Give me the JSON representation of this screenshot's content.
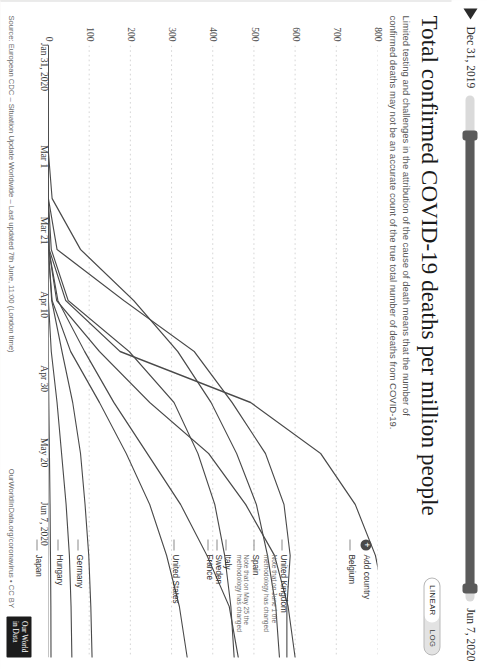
{
  "header": {
    "title": "Total confirmed COVID-19 deaths per million people",
    "subtitle": "Limited testing and challenges in the attribution of the cause of death means that the number of confirmed deaths may not be an accurate count of the true total number of deaths from COVID-19."
  },
  "scale_toggle": {
    "linear_label": "LINEAR",
    "log_label": "LOG",
    "selected": "LINEAR"
  },
  "timeline": {
    "start_label": "Dec 31, 2019",
    "end_label": "Jun 7, 2020",
    "play_icon": "play-icon"
  },
  "legend": {
    "add_country_label": "Add country",
    "add_icon": "plus-circle-icon"
  },
  "footer": {
    "source": "Source: European CDC – Situation Update Worldwide – Last updated 7th June, 11:00 (London time)",
    "owid_link": "OurWorldInData.org/coronavirus • CC BY",
    "logo_line1": "Our World",
    "logo_line2": "in Data"
  },
  "chart_data": {
    "type": "line",
    "title": "Total confirmed COVID-19 deaths per million people",
    "subtitle": "Limited testing and challenges in the attribution of the cause of death means that the number of confirmed deaths may not be an accurate count of the true total number of deaths from COVID-19.",
    "xlabel": "",
    "ylabel": "",
    "scale": "linear",
    "grid": true,
    "legend_position": "right",
    "xlim": [
      "2020-01-31",
      "2020-06-07"
    ],
    "ylim": [
      0,
      800
    ],
    "yticks": [
      0,
      100,
      200,
      300,
      400,
      500,
      600,
      700,
      800
    ],
    "xticks": [
      "Jan 31, 2020",
      "Mar 1",
      "Mar 21",
      "Apr 10",
      "Apr 30",
      "May 20",
      "Jun 7, 2020"
    ],
    "x": [
      "Jan 31",
      "Feb 20",
      "Mar 1",
      "Mar 11",
      "Mar 21",
      "Mar 31",
      "Apr 10",
      "Apr 20",
      "Apr 30",
      "May 10",
      "May 20",
      "May 30",
      "Jun 7"
    ],
    "series": [
      {
        "name": "Belgium",
        "note": "",
        "values": [
          0,
          0,
          0,
          0.3,
          3,
          43,
          175,
          492,
          662,
          746,
          795,
          820,
          832
        ]
      },
      {
        "name": "United Kingdom",
        "note": "Note that on June 1 the methodology has changed",
        "values": [
          0,
          0,
          0,
          0.2,
          2,
          21,
          125,
          247,
          390,
          480,
          550,
          583,
          600
        ]
      },
      {
        "name": "Spain",
        "note": "Note that on May 25 the methodology has changed",
        "values": [
          0,
          0,
          0,
          1,
          22,
          184,
          355,
          447,
          528,
          573,
          588,
          580,
          580
        ]
      },
      {
        "name": "Italy",
        "note": "",
        "values": [
          0,
          0,
          0.1,
          10,
          79,
          208,
          315,
          396,
          458,
          506,
          533,
          553,
          562
        ]
      },
      {
        "name": "Sweden",
        "note": "",
        "values": [
          0,
          0,
          0,
          0.1,
          2,
          24,
          89,
          160,
          241,
          322,
          386,
          440,
          462
        ]
      },
      {
        "name": "France",
        "note": "",
        "values": [
          0,
          0,
          0.03,
          0.7,
          8,
          49,
          197,
          306,
          364,
          405,
          429,
          444,
          452
        ]
      },
      {
        "name": "United States",
        "note": "",
        "values": [
          0,
          0,
          0,
          0.1,
          0.8,
          10,
          55,
          125,
          190,
          247,
          288,
          319,
          338
        ]
      },
      {
        "name": "Germany",
        "note": "",
        "values": [
          0,
          0,
          0,
          0.03,
          0.8,
          9,
          34,
          60,
          79,
          90,
          99,
          104,
          107
        ]
      },
      {
        "name": "Hungary",
        "note": "",
        "values": [
          0,
          0,
          0,
          0,
          0.1,
          1,
          8,
          22,
          33,
          44,
          52,
          56,
          58
        ]
      },
      {
        "name": "Japan",
        "note": "",
        "values": [
          0,
          0,
          0.04,
          0.1,
          0.3,
          0.5,
          1,
          2,
          3.5,
          5,
          6,
          7,
          7.3
        ]
      }
    ]
  }
}
